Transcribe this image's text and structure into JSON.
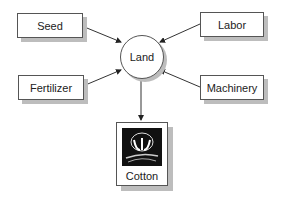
{
  "diagram": {
    "center": {
      "label": "Land"
    },
    "inputs": [
      {
        "label": "Seed"
      },
      {
        "label": "Labor"
      },
      {
        "label": "Fertilizer"
      },
      {
        "label": "Machinery"
      }
    ],
    "output": {
      "label": "Cotton",
      "icon": "cotton-boll-icon"
    }
  }
}
